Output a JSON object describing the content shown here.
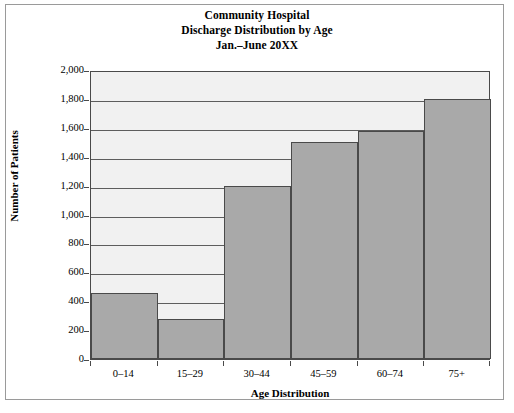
{
  "chart_data": {
    "type": "bar",
    "title": "Community Hospital\nDischarge Distribution by Age\nJan.–June 20XX",
    "title_lines": [
      "Community Hospital",
      "Discharge Distribution by Age",
      "Jan.–June 20XX"
    ],
    "categories": [
      "0–14",
      "15–29",
      "30–44",
      "45–59",
      "60–74",
      "75+"
    ],
    "values": [
      460,
      280,
      1200,
      1500,
      1580,
      1800
    ],
    "xlabel": "Age Distribution",
    "ylabel": "Number of Patients",
    "ylim": [
      0,
      2000
    ],
    "ytick_step": 200,
    "ytick_labels": [
      "0",
      "200",
      "400",
      "600",
      "800",
      "1,000",
      "1,200",
      "1,400",
      "1,600",
      "1,800",
      "2,000"
    ],
    "ytick_values": [
      0,
      200,
      400,
      600,
      800,
      1000,
      1200,
      1400,
      1600,
      1800,
      2000
    ],
    "grid": true,
    "grid_axis": "y",
    "legend": null,
    "bar_color": "#a9a9a9",
    "bar_edge_color": "#4a4a4a",
    "plot_background": "#f1f1f1",
    "axis_color": "#4a4a4a",
    "text_color": "#000000",
    "figure_background": "#ffffff",
    "bar_gap": 0
  }
}
